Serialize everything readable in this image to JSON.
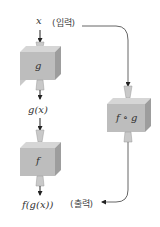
{
  "diagram": {
    "input_label": "x",
    "input_note": "(입력)",
    "output_note": "(출력)",
    "machines": [
      {
        "id": "g",
        "label": "g",
        "output_label": "g(x)"
      },
      {
        "id": "f",
        "label": "f",
        "output_label": "f(g(x))"
      },
      {
        "id": "fog",
        "label": "f ∘ g"
      }
    ],
    "colors": {
      "box_front": "#b9b9b9",
      "box_side": "#9d9d9d",
      "box_top": "#d6d6d6",
      "funnel": "#c9c9c9",
      "wire": "#666666",
      "arrow": "#222222"
    }
  }
}
